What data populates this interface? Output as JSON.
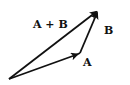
{
  "diagram": {
    "type": "vector-addition",
    "stroke_color": "#111111",
    "background": "#ffffff",
    "points": {
      "origin": [
        9,
        79
      ],
      "a_tip": [
        79,
        54
      ],
      "b_tip": [
        98,
        10
      ]
    },
    "vectors": [
      {
        "id": "A",
        "from": "origin",
        "to": "a_tip",
        "label": "A"
      },
      {
        "id": "B",
        "from": "a_tip",
        "to": "b_tip",
        "label": "B"
      },
      {
        "id": "A+B",
        "from": "origin",
        "to": "b_tip",
        "label": "A + B"
      }
    ],
    "labels": {
      "sum": "A + B",
      "b": "B",
      "a": "A"
    }
  }
}
